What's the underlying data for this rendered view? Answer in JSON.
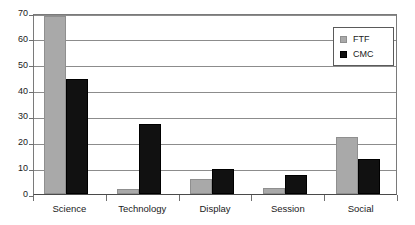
{
  "chart_data": {
    "type": "bar",
    "title": "",
    "subtitle": "",
    "xlabel": "",
    "ylabel": "",
    "categories": [
      "Science",
      "Technology",
      "Display",
      "Session",
      "Social"
    ],
    "series": [
      {
        "name": "FTF",
        "color": "#a9a9a9",
        "values": [
          69,
          2,
          6,
          2.5,
          22
        ]
      },
      {
        "name": "CMC",
        "color": "#111111",
        "values": [
          44.5,
          27,
          9.5,
          7.5,
          13.5
        ]
      }
    ],
    "ylim": [
      0,
      70
    ],
    "ytick_step": 10,
    "yticks": [
      0,
      10,
      20,
      30,
      40,
      50,
      60,
      70
    ],
    "ytick_labels": [
      "0",
      "10",
      "20",
      "30",
      "40",
      "50",
      "60",
      "70"
    ],
    "grid": true,
    "grid_axis": "y",
    "legend": [
      "FTF",
      "CMC"
    ],
    "legend_position": "top-right",
    "annotations": []
  },
  "legend": {
    "items": [
      {
        "label": "FTF",
        "swatch": "ftf-swatch"
      },
      {
        "label": "CMC",
        "swatch": "cmc-swatch"
      }
    ]
  }
}
